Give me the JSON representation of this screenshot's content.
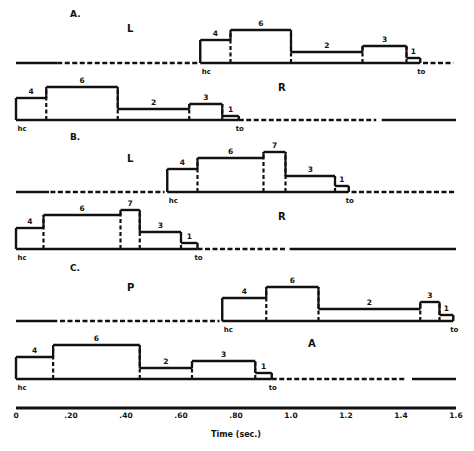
{
  "chart_data": {
    "type": "bar",
    "title": "",
    "xlabel": "Time (sec.)",
    "ylabel": "",
    "xlim": [
      0,
      1.6
    ],
    "x_ticks": [
      {
        "value": 0,
        "label": "0"
      },
      {
        "value": 0.2,
        "label": ".20"
      },
      {
        "value": 0.4,
        "label": ".40"
      },
      {
        "value": 0.6,
        "label": ".60"
      },
      {
        "value": 0.8,
        "label": ".80"
      },
      {
        "value": 1.0,
        "label": "1.0"
      },
      {
        "value": 1.2,
        "label": "1.2"
      },
      {
        "value": 1.4,
        "label": "1.4"
      },
      {
        "value": 1.6,
        "label": "1.6"
      }
    ],
    "grid": false,
    "event_labels": {
      "start": "hc",
      "end": "to"
    },
    "panels": [
      {
        "panel": "A.",
        "rows": [
          {
            "label": "L",
            "hc": 0.67,
            "to": 1.47,
            "pre_segments": [
              {
                "from": 0,
                "to": 0.15,
                "style": "solid"
              },
              {
                "from": 0.15,
                "to": 0.66,
                "style": "dashed"
              }
            ],
            "post_segments": [
              {
                "from": 1.48,
                "to": 1.59,
                "style": "dashed"
              }
            ],
            "phases": [
              {
                "label": "4",
                "start": 0.67,
                "end": 0.78,
                "height": 23
              },
              {
                "label": "6",
                "start": 0.78,
                "end": 1.0,
                "height": 33
              },
              {
                "label": "2",
                "start": 1.0,
                "end": 1.26,
                "height": 11
              },
              {
                "label": "3",
                "start": 1.26,
                "end": 1.42,
                "height": 17
              },
              {
                "label": "1",
                "start": 1.42,
                "end": 1.47,
                "height": 5
              }
            ]
          },
          {
            "label": "R",
            "hc": 0.0,
            "to": 0.81,
            "pre_segments": [],
            "post_segments": [
              {
                "from": 0.81,
                "to": 1.31,
                "style": "dashed"
              },
              {
                "from": 1.33,
                "to": 1.6,
                "style": "solid"
              }
            ],
            "phases": [
              {
                "label": "4",
                "start": 0.0,
                "end": 0.11,
                "height": 22
              },
              {
                "label": "6",
                "start": 0.11,
                "end": 0.37,
                "height": 33
              },
              {
                "label": "2",
                "start": 0.37,
                "end": 0.63,
                "height": 11
              },
              {
                "label": "3",
                "start": 0.63,
                "end": 0.75,
                "height": 16
              },
              {
                "label": "1",
                "start": 0.75,
                "end": 0.81,
                "height": 4
              }
            ]
          }
        ]
      },
      {
        "panel": "B.",
        "rows": [
          {
            "label": "L",
            "hc": 0.55,
            "to": 1.21,
            "pre_segments": [
              {
                "from": 0,
                "to": 0.12,
                "style": "solid"
              },
              {
                "from": 0.125,
                "to": 0.54,
                "style": "dashed"
              }
            ],
            "post_segments": [
              {
                "from": 1.22,
                "to": 1.6,
                "style": "dashed"
              }
            ],
            "phases": [
              {
                "label": "4",
                "start": 0.55,
                "end": 0.66,
                "height": 23
              },
              {
                "label": "6",
                "start": 0.66,
                "end": 0.9,
                "height": 34
              },
              {
                "label": "7",
                "start": 0.9,
                "end": 0.98,
                "height": 40
              },
              {
                "label": "3",
                "start": 0.98,
                "end": 1.16,
                "height": 16
              },
              {
                "label": "1",
                "start": 1.16,
                "end": 1.21,
                "height": 6
              }
            ]
          },
          {
            "label": "R",
            "hc": 0.0,
            "to": 0.66,
            "pre_segments": [],
            "post_segments": [
              {
                "from": 0.66,
                "to": 0.98,
                "style": "dashed"
              },
              {
                "from": 0.995,
                "to": 1.6,
                "style": "solid"
              }
            ],
            "phases": [
              {
                "label": "4",
                "start": 0.0,
                "end": 0.1,
                "height": 21
              },
              {
                "label": "6",
                "start": 0.1,
                "end": 0.38,
                "height": 34
              },
              {
                "label": "7",
                "start": 0.38,
                "end": 0.45,
                "height": 39
              },
              {
                "label": "3",
                "start": 0.45,
                "end": 0.6,
                "height": 17
              },
              {
                "label": "1",
                "start": 0.6,
                "end": 0.66,
                "height": 6
              }
            ]
          }
        ]
      },
      {
        "panel": "C.",
        "rows": [
          {
            "label": "P",
            "hc": 0.75,
            "to": 1.59,
            "pre_segments": [
              {
                "from": 0,
                "to": 0.15,
                "style": "solid"
              },
              {
                "from": 0.16,
                "to": 0.74,
                "style": "dashed"
              }
            ],
            "post_segments": [],
            "phases": [
              {
                "label": "4",
                "start": 0.75,
                "end": 0.91,
                "height": 23
              },
              {
                "label": "6",
                "start": 0.91,
                "end": 1.1,
                "height": 34
              },
              {
                "label": "2",
                "start": 1.1,
                "end": 1.47,
                "height": 12
              },
              {
                "label": "3",
                "start": 1.47,
                "end": 1.54,
                "height": 19
              },
              {
                "label": "1",
                "start": 1.54,
                "end": 1.59,
                "height": 6
              }
            ]
          },
          {
            "label": "A",
            "hc": 0.0,
            "to": 0.93,
            "pre_segments": [],
            "post_segments": [
              {
                "from": 0.93,
                "to": 1.42,
                "style": "dashed"
              },
              {
                "from": 1.44,
                "to": 1.6,
                "style": "solid"
              }
            ],
            "phases": [
              {
                "label": "4",
                "start": 0.0,
                "end": 0.135,
                "height": 22
              },
              {
                "label": "6",
                "start": 0.135,
                "end": 0.45,
                "height": 34
              },
              {
                "label": "2",
                "start": 0.45,
                "end": 0.64,
                "height": 11
              },
              {
                "label": "3",
                "start": 0.64,
                "end": 0.87,
                "height": 18
              },
              {
                "label": "1",
                "start": 0.87,
                "end": 0.93,
                "height": 6
              }
            ]
          }
        ]
      }
    ]
  },
  "layout": {
    "x0_px": 16,
    "px_per_sec": 275,
    "panel_title_pos": [
      [
        70,
        17
      ],
      [
        70,
        140
      ],
      [
        70,
        271
      ]
    ],
    "row_baselines": [
      [
        63,
        120
      ],
      [
        192,
        249
      ],
      [
        321,
        379
      ]
    ],
    "row_label_pos": [
      [
        [
          127,
          32
        ]
      ],
      [
        [
          278,
          91
        ]
      ],
      [
        [
          127,
          162
        ]
      ],
      [
        [
          278,
          220
        ]
      ],
      [
        [
          127,
          291
        ]
      ],
      [
        [
          308,
          347
        ]
      ]
    ],
    "axis_y": 408
  }
}
